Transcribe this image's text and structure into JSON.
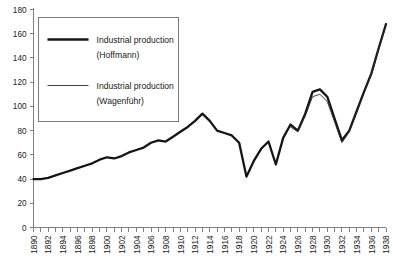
{
  "chart_data": {
    "type": "line",
    "title": "",
    "xlabel": "",
    "ylabel": "",
    "ylim": [
      0,
      180
    ],
    "ytick_step": 20,
    "yticks": [
      0,
      20,
      40,
      60,
      80,
      100,
      120,
      140,
      160,
      180
    ],
    "xlim": [
      1890,
      1938
    ],
    "xtick_step": 1,
    "xtick_label_step": 2,
    "xticklabels": [
      "1890",
      "1892",
      "1894",
      "1896",
      "1898",
      "1900",
      "1902",
      "1904",
      "1906",
      "1908",
      "1910",
      "1912",
      "1914",
      "1916",
      "1918",
      "1920",
      "1922",
      "1924",
      "1926",
      "1928",
      "1930",
      "1932",
      "1934",
      "1936",
      "1938"
    ],
    "grid": false,
    "legend_position": "upper-left",
    "x": [
      1890,
      1891,
      1892,
      1893,
      1894,
      1895,
      1896,
      1897,
      1898,
      1899,
      1900,
      1901,
      1902,
      1903,
      1904,
      1905,
      1906,
      1907,
      1908,
      1909,
      1910,
      1911,
      1912,
      1913,
      1914,
      1915,
      1916,
      1917,
      1918,
      1919,
      1920,
      1921,
      1922,
      1923,
      1924,
      1925,
      1926,
      1927,
      1928,
      1929,
      1930,
      1931,
      1932,
      1933,
      1934,
      1935,
      1936,
      1937,
      1938
    ],
    "series": [
      {
        "name": "Industrial production (Hoffmann)",
        "line_style": "thick",
        "color": "#151515",
        "values": [
          40,
          40,
          41,
          43,
          45,
          47,
          49,
          51,
          53,
          56,
          58,
          57,
          59,
          62,
          64,
          66,
          70,
          72,
          71,
          75,
          79,
          83,
          88,
          94,
          88,
          80,
          78,
          76,
          70,
          42,
          55,
          65,
          71,
          52,
          74,
          85,
          80,
          94,
          112,
          114,
          108,
          90,
          72,
          80,
          96,
          112,
          127,
          148,
          168
        ]
      },
      {
        "name": "Industrial production (Wagenführ)",
        "line_style": "thin",
        "color": "#2b2b2b",
        "values": [
          null,
          null,
          null,
          null,
          null,
          null,
          null,
          null,
          null,
          null,
          null,
          null,
          null,
          null,
          null,
          null,
          null,
          null,
          null,
          null,
          null,
          null,
          null,
          null,
          null,
          null,
          null,
          null,
          null,
          null,
          null,
          null,
          null,
          null,
          null,
          83,
          79,
          92,
          108,
          110,
          104,
          87,
          70,
          79,
          95,
          111,
          126,
          147,
          167
        ]
      }
    ],
    "legend": [
      {
        "label_line1": "Industrial production",
        "label_line2": "(Hoffmann)",
        "style": "thick"
      },
      {
        "label_line1": "Industrial production",
        "label_line2": "(Wagenführ)",
        "style": "thin"
      }
    ]
  }
}
